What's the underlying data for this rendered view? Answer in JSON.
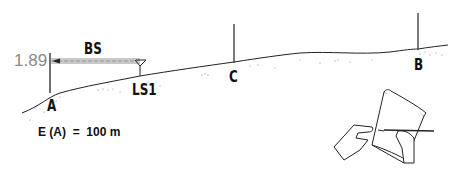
{
  "diagram": {
    "type": "leveling-survey-illustration",
    "staff_reading": "1.89",
    "sight_label": "BS",
    "points": {
      "A": "A",
      "level_station": "LS1",
      "C": "C",
      "B": "B"
    },
    "elevation_statement": "E (A)  =  100 m",
    "colors": {
      "ink": "#111111",
      "staff_reading": "#8a8a8a",
      "sight_band": "#c8c8c8",
      "background": "#ffffff"
    }
  }
}
